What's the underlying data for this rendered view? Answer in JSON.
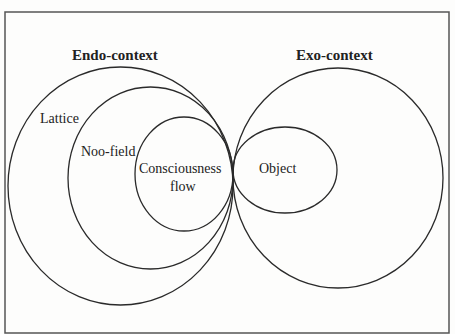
{
  "diagram": {
    "frame_color": "#555555",
    "stroke_color": "#2a2a2a",
    "endo": {
      "title": "Endo-context",
      "regions": [
        {
          "label": "Lattice",
          "level": "outer"
        },
        {
          "label": "Noo-field",
          "level": "middle"
        },
        {
          "label_line1": "Consciousness",
          "label_line2": "flow",
          "level": "inner"
        }
      ]
    },
    "exo": {
      "title": "Exo-context",
      "regions": [
        {
          "label": "Object",
          "level": "inner"
        }
      ]
    }
  }
}
